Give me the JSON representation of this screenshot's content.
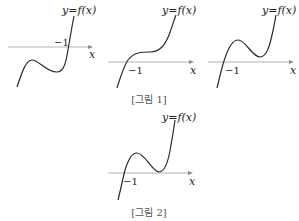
{
  "figure1": {
    "caption": "[그림 1]",
    "graphs": [
      {
        "function_label": "y=f(x)",
        "axis_label": "x",
        "tick_label": "−1",
        "shape": "local max and local min both below x-axis, single root at x=-1"
      },
      {
        "function_label": "y=f(x)",
        "axis_label": "x",
        "tick_label": "−1",
        "shape": "monotonic increasing with inflection, root at x=-1"
      },
      {
        "function_label": "y=f(x)",
        "axis_label": "x",
        "tick_label": "−1",
        "shape": "local max and local min both above x-axis, single root at x=-1"
      }
    ]
  },
  "figure2": {
    "caption": "[그림 2]",
    "graph": {
      "function_label": "y=f(x)",
      "axis_label": "x",
      "tick_label": "−1",
      "shape": "root at x=-1, local max above axis, local min tangent to x-axis"
    }
  }
}
